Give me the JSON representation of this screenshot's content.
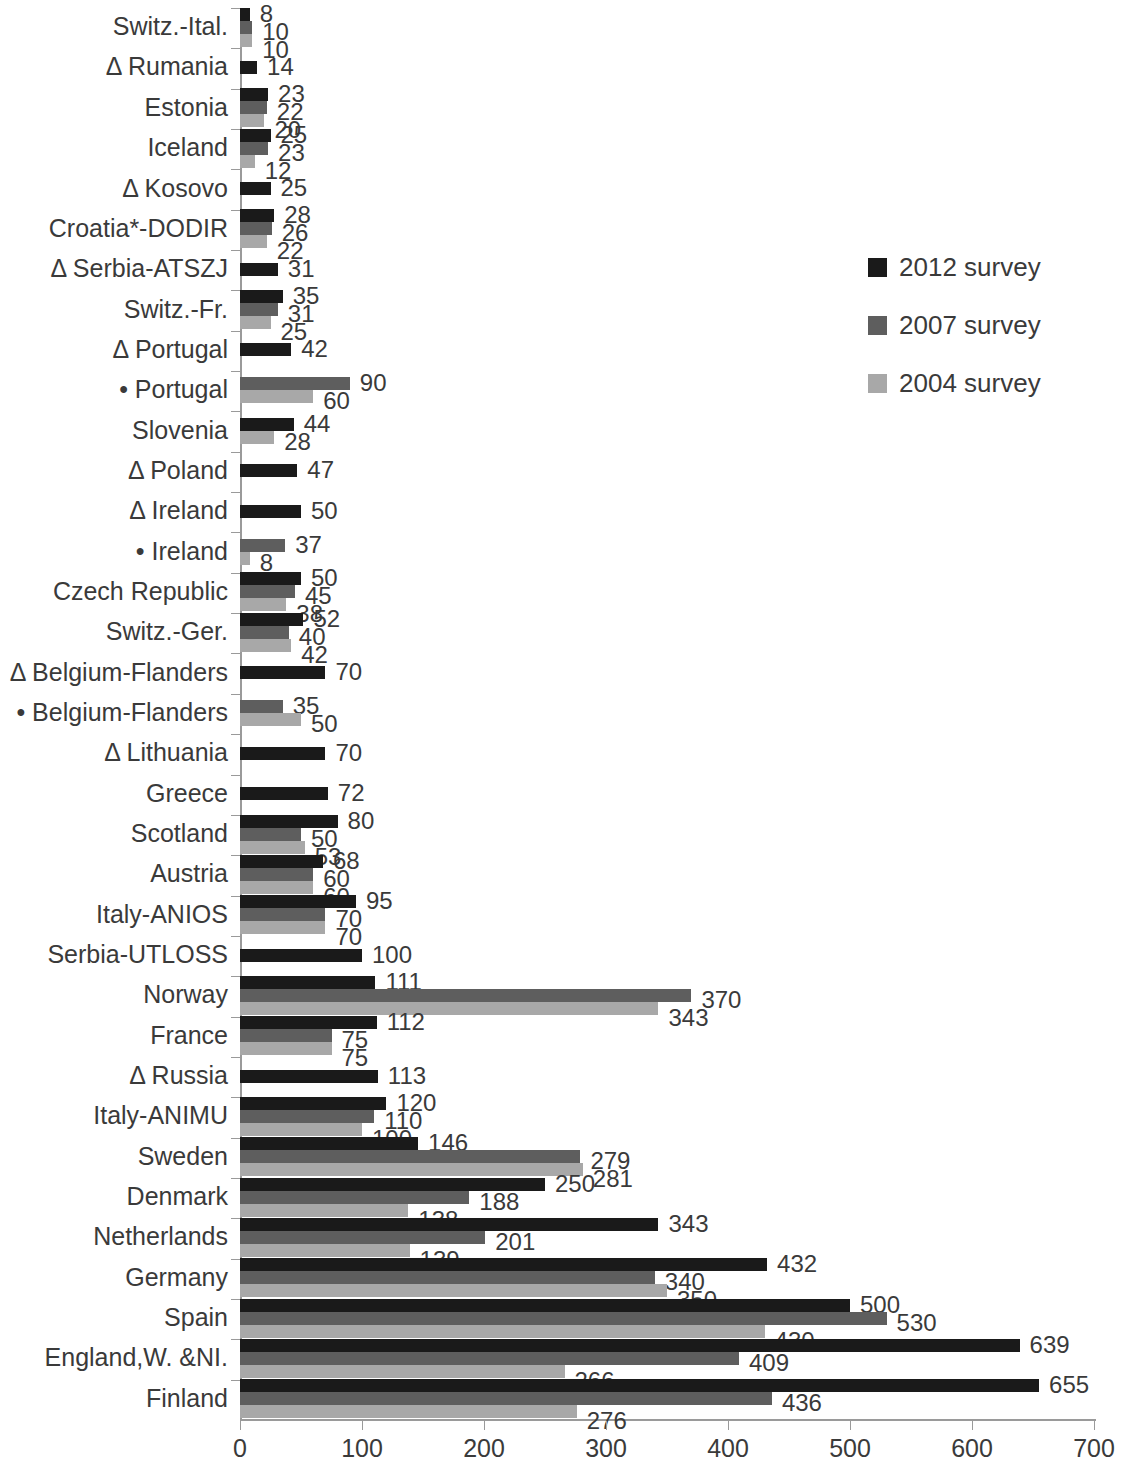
{
  "chart_data": {
    "type": "bar",
    "orientation": "horizontal",
    "title": "",
    "xlabel": "",
    "ylabel": "",
    "xlim": [
      0,
      700
    ],
    "xticks": [
      0,
      100,
      200,
      300,
      400,
      500,
      600,
      700
    ],
    "grid": false,
    "legend_position": "right",
    "series": [
      {
        "name": "2012 survey",
        "color": "#1a1a1a"
      },
      {
        "name": "2007 survey",
        "color": "#5e5e5e"
      },
      {
        "name": "2004 survey",
        "color": "#a8a8a8"
      }
    ],
    "categories": [
      "Switz.-Ital.",
      "Δ Rumania",
      "Estonia",
      "Iceland",
      "Δ Kosovo",
      "Croatia*-DODIR",
      "Δ Serbia-ATSZJ",
      "Switz.-Fr.",
      "Δ Portugal",
      "• Portugal",
      "Slovenia",
      "Δ Poland",
      "Δ Ireland",
      "• Ireland",
      "Czech Republic",
      "Switz.-Ger.",
      "Δ Belgium-Flanders",
      "• Belgium-Flanders",
      "Δ Lithuania",
      "Greece",
      "Scotland",
      "Austria",
      "Italy-ANIOS",
      "Serbia-UTLOSS",
      "Norway",
      "France",
      "Δ Russia",
      "Italy-ANIMU",
      "Sweden",
      "Denmark",
      "Netherlands",
      "Germany",
      "Spain",
      "England,W. &NI.",
      "Finland"
    ],
    "rows": [
      {
        "label": "Switz.-Ital.",
        "values": [
          8,
          10,
          10
        ]
      },
      {
        "label": "Δ Rumania",
        "values": [
          14,
          null,
          null
        ]
      },
      {
        "label": "Estonia",
        "values": [
          23,
          22,
          20
        ]
      },
      {
        "label": "Iceland",
        "values": [
          25,
          23,
          12
        ]
      },
      {
        "label": "Δ Kosovo",
        "values": [
          25,
          null,
          null
        ]
      },
      {
        "label": "Croatia*-DODIR",
        "values": [
          28,
          26,
          22
        ]
      },
      {
        "label": "Δ Serbia-ATSZJ",
        "values": [
          31,
          null,
          null
        ]
      },
      {
        "label": "Switz.-Fr.",
        "values": [
          35,
          31,
          25
        ]
      },
      {
        "label": "Δ Portugal",
        "values": [
          42,
          null,
          null
        ]
      },
      {
        "label": "• Portugal",
        "values": [
          null,
          90,
          60
        ]
      },
      {
        "label": "Slovenia",
        "values": [
          44,
          null,
          28
        ]
      },
      {
        "label": "Δ Poland",
        "values": [
          47,
          null,
          null
        ]
      },
      {
        "label": "Δ Ireland",
        "values": [
          50,
          null,
          null
        ]
      },
      {
        "label": "• Ireland",
        "values": [
          null,
          37,
          8
        ]
      },
      {
        "label": "Czech Republic",
        "values": [
          50,
          45,
          38
        ]
      },
      {
        "label": "Switz.-Ger.",
        "values": [
          52,
          40,
          42
        ]
      },
      {
        "label": "Δ Belgium-Flanders",
        "values": [
          70,
          null,
          null
        ]
      },
      {
        "label": "• Belgium-Flanders",
        "values": [
          null,
          35,
          50
        ]
      },
      {
        "label": "Δ Lithuania",
        "values": [
          70,
          null,
          null
        ]
      },
      {
        "label": "Greece",
        "values": [
          72,
          null,
          null
        ]
      },
      {
        "label": "Scotland",
        "values": [
          80,
          50,
          53
        ]
      },
      {
        "label": "Austria",
        "values": [
          68,
          60,
          60
        ]
      },
      {
        "label": "Italy-ANIOS",
        "values": [
          95,
          70,
          70
        ]
      },
      {
        "label": "Serbia-UTLOSS",
        "values": [
          100,
          null,
          null
        ]
      },
      {
        "label": "Norway",
        "values": [
          111,
          370,
          343
        ]
      },
      {
        "label": "France",
        "values": [
          112,
          75,
          75
        ]
      },
      {
        "label": "Δ Russia",
        "values": [
          113,
          null,
          null
        ]
      },
      {
        "label": "Italy-ANIMU",
        "values": [
          120,
          110,
          100
        ]
      },
      {
        "label": "Sweden",
        "values": [
          146,
          279,
          281
        ]
      },
      {
        "label": "Denmark",
        "values": [
          250,
          188,
          138
        ]
      },
      {
        "label": "Netherlands",
        "values": [
          343,
          201,
          139
        ]
      },
      {
        "label": "Germany",
        "values": [
          432,
          340,
          350
        ]
      },
      {
        "label": "Spain",
        "values": [
          500,
          530,
          430
        ]
      },
      {
        "label": "England,W. &NI.",
        "values": [
          639,
          409,
          266
        ]
      },
      {
        "label": "Finland",
        "values": [
          655,
          436,
          276
        ]
      }
    ]
  },
  "legend": {
    "items": [
      {
        "label": "2012 survey",
        "color": "#1a1a1a"
      },
      {
        "label": "2007 survey",
        "color": "#5e5e5e"
      },
      {
        "label": "2004 survey",
        "color": "#a8a8a8"
      }
    ]
  },
  "axis": {
    "x_tick_labels": [
      "0",
      "100",
      "200",
      "300",
      "400",
      "500",
      "600",
      "700"
    ]
  }
}
